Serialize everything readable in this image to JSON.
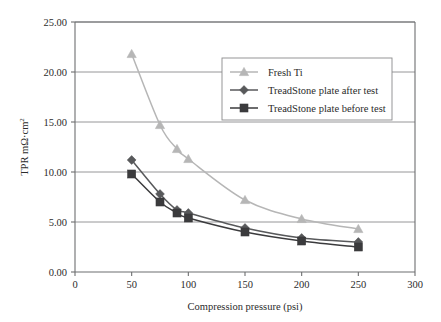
{
  "chart_data": {
    "type": "line",
    "title": "",
    "xlabel": "Compression pressure (psi)",
    "ylabel": "TPR mΩ·cm²",
    "ylabel_base": "TPR mΩ·cm",
    "ylabel_sup": "2",
    "xlim": [
      0,
      300
    ],
    "ylim": [
      0,
      25
    ],
    "xticks": [
      "0",
      "50",
      "100",
      "150",
      "200",
      "250",
      "300"
    ],
    "xtick_values": [
      0,
      50,
      100,
      150,
      200,
      250,
      300
    ],
    "yticks": [
      "0.00",
      "5.00",
      "10.00",
      "15.00",
      "20.00",
      "25.00"
    ],
    "ytick_values": [
      0,
      5,
      10,
      15,
      20,
      25
    ],
    "grid": "horizontal",
    "legend_position": "upper-right-inside",
    "series": [
      {
        "name": "Fresh Ti",
        "marker": "triangle",
        "color": "#b6b6b6",
        "x": [
          50,
          75,
          90,
          100,
          150,
          200,
          250
        ],
        "values": [
          21.8,
          14.7,
          12.3,
          11.3,
          7.2,
          5.3,
          4.3
        ]
      },
      {
        "name": "TreadStone plate after test",
        "marker": "diamond",
        "color": "#58595b",
        "x": [
          50,
          75,
          90,
          100,
          150,
          200,
          250
        ],
        "values": [
          11.2,
          7.8,
          6.2,
          5.9,
          4.4,
          3.4,
          3.0
        ]
      },
      {
        "name": "TreadStone plate before test",
        "marker": "square",
        "color": "#3b3b3d",
        "x": [
          50,
          75,
          90,
          100,
          150,
          200,
          250
        ],
        "values": [
          9.8,
          7.0,
          5.9,
          5.4,
          4.0,
          3.1,
          2.5
        ]
      }
    ]
  },
  "colors": {
    "axis": "#6d6e70",
    "grid": "#8a8a8c",
    "text": "#2b2b2b",
    "legend_border": "#8a8a8c",
    "series_fresh_ti": "#b6b6b6",
    "series_after": "#58595b",
    "series_before": "#3b3b3d"
  }
}
